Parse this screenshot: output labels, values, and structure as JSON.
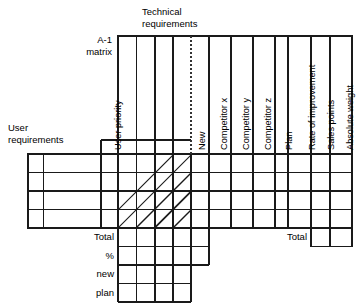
{
  "diagram": {
    "title_block": {
      "technical_requirements": "Technical\nrequirements",
      "technical_requirements_line1": "Technical",
      "technical_requirements_line2": "requirements",
      "matrix_label_line1": "A-1",
      "matrix_label_line2": "matrix",
      "user_requirements_line1": "User",
      "user_requirements_line2": "requirements"
    },
    "columns": {
      "user_priority": "User priority",
      "technical_requirement_columns": [
        "",
        "",
        "",
        ""
      ],
      "evaluation": [
        "New",
        "Competitor x",
        "Competitor y",
        "Competitor z",
        "Plan",
        "Rate of improvement",
        "Sales points",
        "Absolute weight",
        "Requirement weight"
      ]
    },
    "body_rows": [
      "",
      "",
      "",
      ""
    ],
    "footer_rows": {
      "total": "Total",
      "percent": "%",
      "new": "new",
      "plan": "plan"
    },
    "right_footer": {
      "total": "Total"
    },
    "colors": {
      "line": "#1a1a1a",
      "line_light": "#555555",
      "background": "#ffffff",
      "dotted_line": "#444444"
    }
  }
}
